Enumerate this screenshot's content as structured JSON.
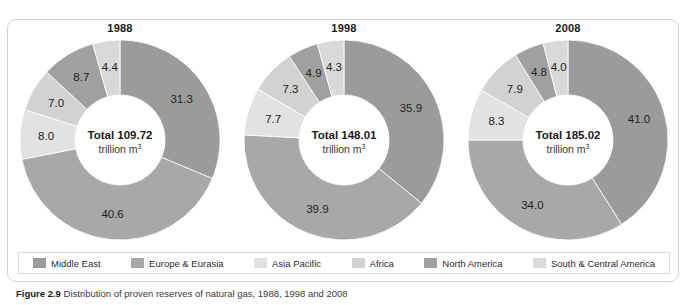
{
  "clipped_header": {
    "left_fragment": "",
    "right_fragment": ""
  },
  "caption": {
    "label": "Figure 2.9",
    "text": "Distribution of proven reserves of natural gas, 1988, 1998 and 2008"
  },
  "legend": {
    "items": [
      {
        "label": "Middle East",
        "color": "#9b9b9b"
      },
      {
        "label": "Europe & Eurasia",
        "color": "#a8a8a8"
      },
      {
        "label": "Asia  Pacific",
        "color": "#e2e2e2"
      },
      {
        "label": "Africa",
        "color": "#d2d2d2"
      },
      {
        "label": "North America",
        "color": "#a0a0a0"
      },
      {
        "label": "South & Central America",
        "color": "#d9d9d9"
      }
    ]
  },
  "center_unit": {
    "prefix": "trillion m",
    "superscript": "3",
    "total_word": "Total"
  },
  "chart_data": {
    "type": "pie",
    "title": "Distribution of proven reserves of natural gas, 1988, 1998 and 2008",
    "subtitle": "",
    "xlabel": "",
    "ylabel": "",
    "legend_position": "bottom",
    "grid": false,
    "value_unit": "percent",
    "categories": [
      "Middle East",
      "Europe & Eurasia",
      "Asia  Pacific",
      "Africa",
      "North America",
      "South & Central America"
    ],
    "colors": [
      "#9b9b9b",
      "#a8a8a8",
      "#e2e2e2",
      "#d2d2d2",
      "#a0a0a0",
      "#d9d9d9"
    ],
    "charts": [
      {
        "year": "1988",
        "total_value": "109.72",
        "total_unit": "trillion m3",
        "values": [
          31.3,
          40.6,
          8.0,
          7.0,
          8.7,
          4.4
        ],
        "labels": [
          "31.3",
          "40.6",
          "8.0",
          "7.0",
          "8.7",
          "4.4"
        ]
      },
      {
        "year": "1998",
        "total_value": "148.01",
        "total_unit": "trillion m3",
        "values": [
          35.9,
          39.9,
          7.7,
          7.3,
          4.9,
          4.3
        ],
        "labels": [
          "35.9",
          "39.9",
          "7.7",
          "7.3",
          "4.9",
          "4.3"
        ]
      },
      {
        "year": "2008",
        "total_value": "185.02",
        "total_unit": "trillion m3",
        "values": [
          41.0,
          34.0,
          8.3,
          7.9,
          4.8,
          4.0
        ],
        "labels": [
          "41.0",
          "34.0",
          "8.3",
          "7.9",
          "4.8",
          "4.0"
        ]
      }
    ]
  }
}
